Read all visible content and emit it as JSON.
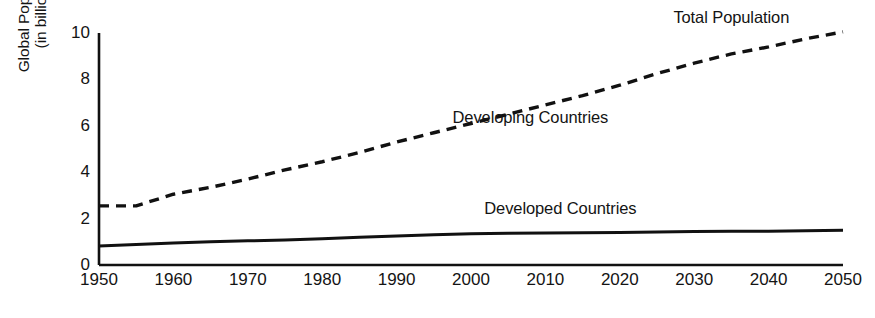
{
  "chart_data": {
    "type": "line",
    "title": "",
    "xlabel": "",
    "ylabel": "Global Population (in billions)",
    "ylabel_lines": [
      "Global Population",
      "(in billions)"
    ],
    "xlim": [
      1950,
      2050
    ],
    "ylim": [
      0,
      10
    ],
    "grid": false,
    "legend_position": "inline-annotations",
    "x": [
      1950,
      1955,
      1960,
      1965,
      1970,
      1975,
      1980,
      1985,
      1990,
      1995,
      2000,
      2005,
      2010,
      2015,
      2020,
      2025,
      2030,
      2035,
      2040,
      2045,
      2050
    ],
    "xticks": [
      "1950",
      "1960",
      "1970",
      "1980",
      "1990",
      "2000",
      "2010",
      "2020",
      "2030",
      "2040",
      "2050"
    ],
    "xtick_values": [
      1950,
      1960,
      1970,
      1980,
      1990,
      2000,
      2010,
      2020,
      2030,
      2040,
      2050
    ],
    "yticks": [
      "0",
      "2",
      "4",
      "6",
      "8",
      "10"
    ],
    "ytick_values": [
      0,
      2,
      4,
      6,
      8,
      10
    ],
    "series": [
      {
        "name": "Total Population",
        "style": "dashed",
        "color": "#111111",
        "values": [
          2.55,
          2.55,
          3.05,
          3.35,
          3.7,
          4.1,
          4.45,
          4.85,
          5.3,
          5.7,
          6.1,
          6.5,
          6.9,
          7.3,
          7.75,
          8.25,
          8.7,
          9.1,
          9.4,
          9.75,
          10.05
        ]
      },
      {
        "name": "Developed Countries",
        "style": "solid",
        "color": "#111111",
        "values": [
          0.82,
          0.88,
          0.95,
          1.0,
          1.04,
          1.08,
          1.13,
          1.2,
          1.25,
          1.3,
          1.35,
          1.37,
          1.38,
          1.39,
          1.4,
          1.42,
          1.44,
          1.45,
          1.46,
          1.48,
          1.5
        ]
      }
    ],
    "annotations": [
      {
        "text": "Total Population",
        "x": 2035,
        "y": 10.6
      },
      {
        "text": "Developing Countries",
        "x": 2008,
        "y": 6.3
      },
      {
        "text": "Developed Countries",
        "x": 2012,
        "y": 2.35
      }
    ]
  },
  "axes": {
    "y_axis_name": "vertical-axis-line",
    "x_axis_name": "horizontal-axis-line"
  }
}
